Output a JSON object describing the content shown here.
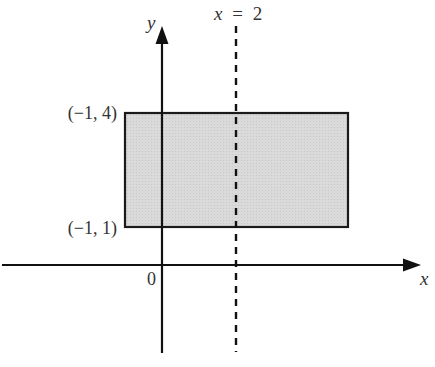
{
  "diagram": {
    "type": "coordinate-plane",
    "axes": {
      "x_label": "x",
      "y_label": "y",
      "origin_label": "0"
    },
    "vertical_line": {
      "label_var": "x",
      "label_eq": "=",
      "label_value": "2",
      "style": "dashed"
    },
    "rectangle": {
      "fill": "#d9d9d9",
      "stroke": "#1a1a1a",
      "corner_labels": {
        "top_left": "(−1, 4)",
        "bottom_left": "(−1, 1)"
      }
    }
  }
}
